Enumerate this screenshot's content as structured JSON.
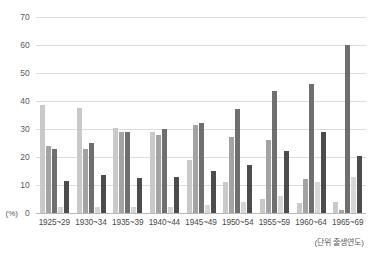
{
  "chart_data": {
    "type": "bar",
    "title": "",
    "xlabel": "(단위 출생연도)",
    "ylabel": "(%)",
    "ylim": [
      0,
      70
    ],
    "yticks": [
      0,
      10,
      20,
      30,
      40,
      50,
      60,
      70
    ],
    "ytick_labels": [
      "0",
      "10",
      "20",
      "30",
      "40",
      "50",
      "60",
      "70"
    ],
    "grid": true,
    "legend": "none",
    "categories": [
      "1925~29",
      "1930~34",
      "1935~39",
      "1940~44",
      "1945~49",
      "1950~54",
      "1955~59",
      "1960~64",
      "1965~69"
    ],
    "series": [
      {
        "name": "series-1",
        "color": "#c9c9c9",
        "values": [
          38.5,
          37.5,
          30.5,
          29.0,
          19.0,
          11.0,
          5.0,
          3.5,
          4.0
        ]
      },
      {
        "name": "series-2",
        "color": "#a3a3a3",
        "values": [
          24.0,
          23.0,
          29.0,
          28.0,
          31.5,
          27.0,
          26.0,
          12.0,
          1.0
        ]
      },
      {
        "name": "series-3",
        "color": "#6f6f6f",
        "values": [
          23.0,
          25.0,
          29.0,
          30.0,
          32.0,
          37.0,
          43.5,
          46.0,
          60.0
        ]
      },
      {
        "name": "series-4",
        "color": "#d6d6d6",
        "values": [
          2.0,
          2.0,
          2.0,
          2.0,
          3.0,
          4.0,
          6.0,
          11.0,
          13.0
        ]
      },
      {
        "name": "series-5",
        "color": "#4c4c4c",
        "values": [
          11.5,
          13.5,
          12.5,
          13.0,
          15.0,
          17.0,
          22.0,
          29.0,
          20.5
        ]
      }
    ]
  }
}
